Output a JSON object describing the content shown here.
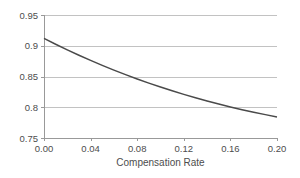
{
  "chart_data": {
    "type": "line",
    "title": "",
    "subtitle": "",
    "xlabel": "Compensation Rate",
    "ylabel": "",
    "xlim": [
      0.0,
      0.2
    ],
    "ylim": [
      0.75,
      0.95
    ],
    "grid": "horizontal",
    "legend": "none",
    "x_ticks": [
      0.0,
      0.04,
      0.08,
      0.12,
      0.16,
      0.2
    ],
    "x_tick_labels": [
      "0.00",
      "0.04",
      "0.08",
      "0.12",
      "0.16",
      "0.20"
    ],
    "y_ticks": [
      0.75,
      0.8,
      0.85,
      0.9,
      0.95
    ],
    "y_tick_labels": [
      "0.75",
      "0.8",
      "0.85",
      "0.9",
      "0.95"
    ],
    "line_color": "#4a4a4a",
    "grid_color": "#b3b3b3",
    "axis_color": "#999999",
    "background_color": "#ffffff",
    "series": [
      {
        "name": "",
        "x": [
          0.0,
          0.01,
          0.02,
          0.03,
          0.04,
          0.05,
          0.06,
          0.07,
          0.08,
          0.09,
          0.1,
          0.11,
          0.12,
          0.13,
          0.14,
          0.15,
          0.16,
          0.17,
          0.18,
          0.19,
          0.2
        ],
        "values": [
          0.912,
          0.9025,
          0.8934,
          0.8846,
          0.8762,
          0.8681,
          0.8604,
          0.853,
          0.846,
          0.8392,
          0.8328,
          0.8267,
          0.8209,
          0.8154,
          0.8102,
          0.8052,
          0.8005,
          0.7961,
          0.7919,
          0.788,
          0.7843
        ]
      }
    ],
    "annotations": []
  },
  "plot_geometry": {
    "left": 44,
    "right": 277,
    "top": 15,
    "bottom": 138
  }
}
